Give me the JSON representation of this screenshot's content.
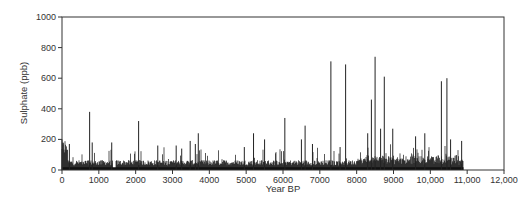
{
  "chart_data": {
    "type": "bar",
    "title": "",
    "xlabel": "Year BP",
    "ylabel": "Sulphate (ppb)",
    "xlim": [
      0,
      12000
    ],
    "ylim": [
      0,
      1000
    ],
    "xticks": [
      0,
      1000,
      2000,
      3000,
      4000,
      5000,
      6000,
      7000,
      8000,
      9000,
      10000,
      11000,
      12000
    ],
    "xtick_labels": [
      "0",
      "1000",
      "2000",
      "3000",
      "4000",
      "5000",
      "6000",
      "7000",
      "8000",
      "9000",
      "10,000",
      "11,000",
      "12,000"
    ],
    "yticks": [
      0,
      200,
      400,
      600,
      800,
      1000
    ],
    "ytick_labels": [
      "0",
      "200",
      "400",
      "600",
      "800",
      "1000"
    ],
    "grid": false,
    "legend": null,
    "data_extent_years": [
      0,
      10900
    ],
    "baseline_ppb_approx": 30,
    "notable_peaks": [
      {
        "x": 0,
        "y": 200
      },
      {
        "x": 200,
        "y": 170
      },
      {
        "x": 750,
        "y": 380
      },
      {
        "x": 820,
        "y": 180
      },
      {
        "x": 1350,
        "y": 180
      },
      {
        "x": 2080,
        "y": 320
      },
      {
        "x": 2600,
        "y": 160
      },
      {
        "x": 3100,
        "y": 160
      },
      {
        "x": 3250,
        "y": 140
      },
      {
        "x": 3480,
        "y": 190
      },
      {
        "x": 3620,
        "y": 170
      },
      {
        "x": 3700,
        "y": 240
      },
      {
        "x": 4950,
        "y": 150
      },
      {
        "x": 5200,
        "y": 240
      },
      {
        "x": 5500,
        "y": 200
      },
      {
        "x": 6050,
        "y": 340
      },
      {
        "x": 6500,
        "y": 200
      },
      {
        "x": 6600,
        "y": 290
      },
      {
        "x": 6800,
        "y": 170
      },
      {
        "x": 7300,
        "y": 710
      },
      {
        "x": 7550,
        "y": 150
      },
      {
        "x": 7700,
        "y": 690
      },
      {
        "x": 8300,
        "y": 240
      },
      {
        "x": 8400,
        "y": 460
      },
      {
        "x": 8500,
        "y": 740
      },
      {
        "x": 8650,
        "y": 270
      },
      {
        "x": 8750,
        "y": 610
      },
      {
        "x": 8980,
        "y": 270
      },
      {
        "x": 9600,
        "y": 220
      },
      {
        "x": 9850,
        "y": 240
      },
      {
        "x": 10300,
        "y": 580
      },
      {
        "x": 10450,
        "y": 600
      },
      {
        "x": 10550,
        "y": 200
      },
      {
        "x": 10850,
        "y": 190
      }
    ]
  }
}
